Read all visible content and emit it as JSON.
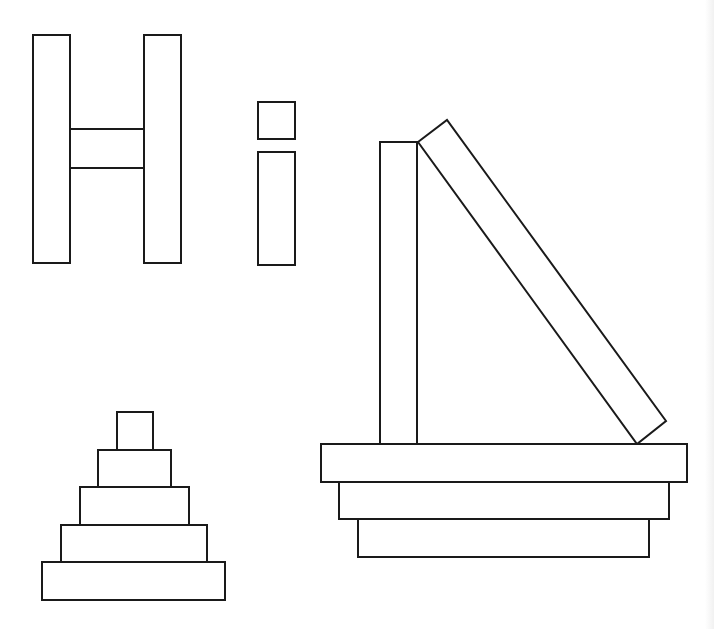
{
  "figure": {
    "stroke_color": "#1a1a1a",
    "fill_color": "#ffffff",
    "background": "#ffffff"
  },
  "groups": {
    "letter_h": {
      "label": "H",
      "blocks": [
        {
          "name": "h-left-bar",
          "x": 33,
          "y": 35,
          "w": 37,
          "h": 228
        },
        {
          "name": "h-crossbar",
          "x": 70,
          "y": 129,
          "w": 74,
          "h": 39
        },
        {
          "name": "h-right-bar",
          "x": 144,
          "y": 35,
          "w": 37,
          "h": 228
        }
      ]
    },
    "letter_i": {
      "label": "i",
      "blocks": [
        {
          "name": "i-dot",
          "x": 258,
          "y": 102,
          "w": 37,
          "h": 37
        },
        {
          "name": "i-stem",
          "x": 258,
          "y": 152,
          "w": 37,
          "h": 113
        }
      ]
    },
    "leaning_structure": {
      "standing_block": {
        "x": 380,
        "y": 142,
        "w": 37,
        "h": 302
      },
      "leaning_block_points": "418,142 447,120 666,421 637,444",
      "base_tiers": [
        {
          "name": "base-tier-top",
          "x": 321,
          "y": 444,
          "w": 366,
          "h": 38
        },
        {
          "name": "base-tier-middle",
          "x": 339,
          "y": 482,
          "w": 330,
          "h": 37
        },
        {
          "name": "base-tier-bottom",
          "x": 358,
          "y": 519,
          "w": 291,
          "h": 38
        }
      ]
    },
    "pyramid": {
      "tiers": [
        {
          "name": "pyramid-tier-1",
          "x": 117,
          "y": 412,
          "w": 36,
          "h": 38
        },
        {
          "name": "pyramid-tier-2",
          "x": 98,
          "y": 450,
          "w": 73,
          "h": 37
        },
        {
          "name": "pyramid-tier-3",
          "x": 80,
          "y": 487,
          "w": 109,
          "h": 38
        },
        {
          "name": "pyramid-tier-4",
          "x": 61,
          "y": 525,
          "w": 146,
          "h": 37
        },
        {
          "name": "pyramid-tier-5",
          "x": 42,
          "y": 562,
          "w": 183,
          "h": 38
        }
      ]
    }
  }
}
